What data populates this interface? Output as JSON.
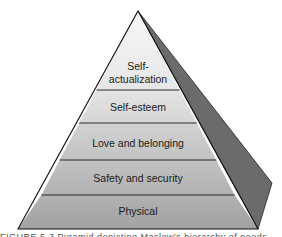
{
  "diagram": {
    "type": "pyramid",
    "title": "Maslow's hierarchy of needs",
    "levels_top_to_bottom": [
      {
        "id": "self-actualization",
        "line1": "Self-",
        "line2": "actualization",
        "fill": "#eeeeee"
      },
      {
        "id": "self-esteem",
        "label": "Self-esteem",
        "fill": "#dcdcdc"
      },
      {
        "id": "love-belonging",
        "label": "Love and belonging",
        "fill": "#c9c9c9"
      },
      {
        "id": "safety-security",
        "label": "Safety and security",
        "fill": "#b8b8b8"
      },
      {
        "id": "physical",
        "label": "Physical",
        "fill": "#a9a9a9"
      }
    ],
    "side_face_color": "#6b6b6b",
    "outline_color": "#111111"
  },
  "caption": {
    "text": "FIGURE 5-3  Pyramid depicting Maslow's hierarchy of needs"
  }
}
